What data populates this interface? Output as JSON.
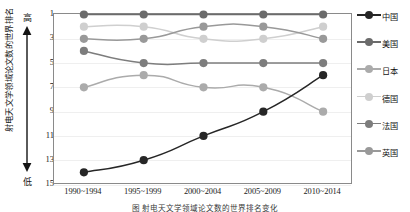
{
  "chart_data": {
    "type": "line",
    "title": "",
    "caption": "图    射电天文学领域论文数的世界排名变化",
    "xlabel": "",
    "ylabel": "射电天文学领域论文数的世界排名",
    "categories": [
      "1990~1994",
      "1995~1999",
      "2000~2004",
      "2005~2009",
      "2010~2014"
    ],
    "ytick_labels": [
      "1",
      "3",
      "5",
      "7",
      "9",
      "11",
      "13",
      "15"
    ],
    "ytick_values": [
      1,
      3,
      5,
      7,
      9,
      11,
      13,
      15
    ],
    "ylim": [
      1,
      15
    ],
    "y_inverted": true,
    "grid": true,
    "legend_position": "right",
    "axis_direction_high": "高",
    "axis_direction_low": "低",
    "series": [
      {
        "name": "中国",
        "color": "#262626",
        "values": [
          14,
          13,
          11,
          9,
          6
        ]
      },
      {
        "name": "美国",
        "color": "#6b6b6b",
        "values": [
          1,
          1,
          1,
          1,
          1
        ]
      },
      {
        "name": "日本",
        "color": "#ababab",
        "values": [
          7,
          6,
          7,
          7,
          9
        ]
      },
      {
        "name": "德国",
        "color": "#cfcfcf",
        "values": [
          2,
          2,
          3,
          3,
          2
        ]
      },
      {
        "name": "法国",
        "color": "#7d7d7d",
        "values": [
          4,
          5,
          5,
          5,
          5
        ]
      },
      {
        "name": "英国",
        "color": "#999999",
        "values": [
          3,
          3,
          2,
          2,
          3
        ]
      }
    ]
  },
  "legend": {
    "items": [
      {
        "label": "中国",
        "icon": "legend-marker-icon"
      },
      {
        "label": "美国",
        "icon": "legend-marker-icon"
      },
      {
        "label": "日本",
        "icon": "legend-marker-icon"
      },
      {
        "label": "德国",
        "icon": "legend-marker-icon"
      },
      {
        "label": "法国",
        "icon": "legend-marker-icon"
      },
      {
        "label": "英国",
        "icon": "legend-marker-icon"
      }
    ]
  },
  "colors": {
    "frame": "#8a8a8a",
    "grid": "#efefef",
    "text": "#1a1a1a",
    "background": "#ffffff"
  }
}
